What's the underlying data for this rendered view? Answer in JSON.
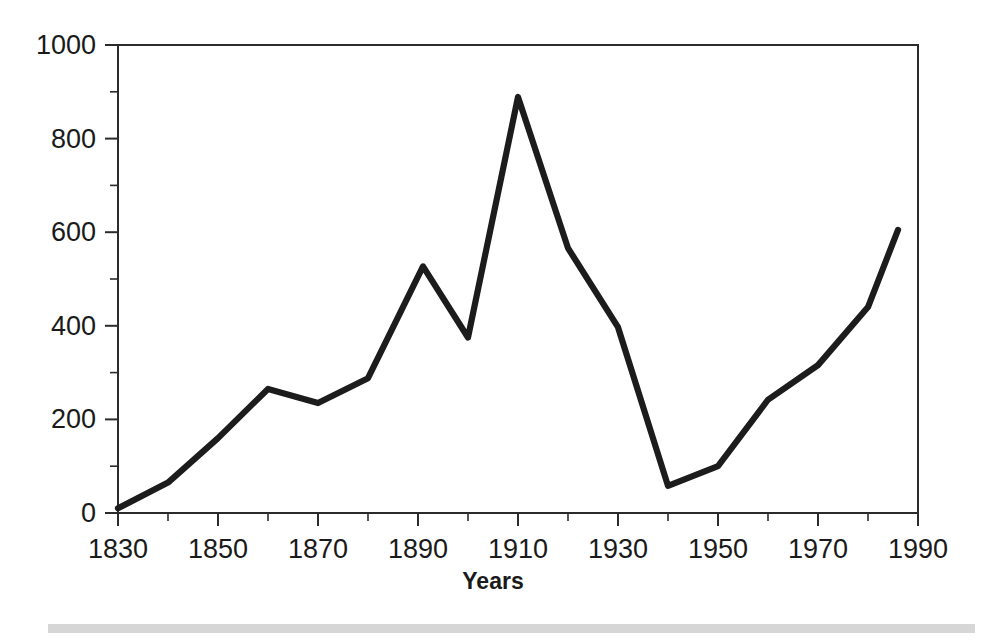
{
  "chart_data": {
    "type": "line",
    "title": "",
    "xlabel": "Years",
    "ylabel": "",
    "xlim": [
      1830,
      1990
    ],
    "ylim": [
      0,
      1000
    ],
    "grid": false,
    "legend": false,
    "x_tick_labels": [
      "1830",
      "1850",
      "1870",
      "1890",
      "1910",
      "1930",
      "1950",
      "1970",
      "1990"
    ],
    "x_tick_values": [
      1830,
      1850,
      1870,
      1890,
      1910,
      1930,
      1950,
      1970,
      1990
    ],
    "x_minor_tick_values": [
      1840,
      1860,
      1880,
      1900,
      1920,
      1940,
      1960,
      1980
    ],
    "y_tick_labels": [
      "0",
      "200",
      "400",
      "600",
      "800",
      "1000"
    ],
    "y_tick_values": [
      0,
      200,
      400,
      600,
      800,
      1000
    ],
    "y_minor_tick_values": [
      100,
      300,
      500,
      700,
      900
    ],
    "series": [
      {
        "name": "series-1",
        "color": "#1c1c1c",
        "x": [
          1830,
          1840,
          1850,
          1860,
          1870,
          1880,
          1891,
          1900,
          1910,
          1920,
          1930,
          1940,
          1950,
          1960,
          1970,
          1980,
          1986
        ],
        "values": [
          10,
          65,
          160,
          265,
          235,
          288,
          527,
          375,
          889,
          566,
          397,
          58,
          100,
          242,
          316,
          440,
          605
        ]
      }
    ]
  },
  "axis": {
    "x_title": "Years"
  },
  "decor": {
    "footer_bar_color": "#cfcfcf"
  }
}
